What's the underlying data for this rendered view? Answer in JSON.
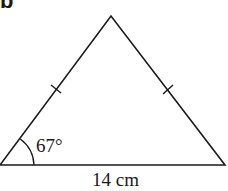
{
  "part_label": "b",
  "diagram": {
    "shape": "isosceles triangle",
    "angle_label": "67°",
    "base_label": "14 cm",
    "equal_sides_marked": true
  }
}
